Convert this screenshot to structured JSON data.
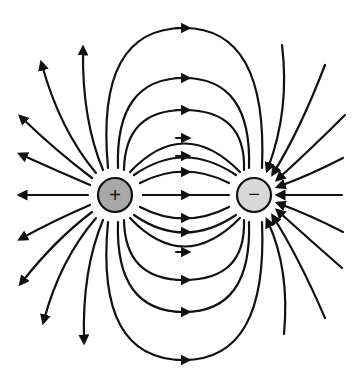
{
  "diagram": {
    "charges": [
      {
        "id": "positive",
        "sign": "+",
        "cx": 115,
        "cy": 195,
        "r": 17,
        "fill": "#a8a8a8"
      },
      {
        "id": "negative",
        "sign": "−",
        "cx": 254,
        "cy": 195,
        "r": 17,
        "fill": "#d8d8d8"
      }
    ],
    "stroke_color": "#111111",
    "background": "#ffffff"
  }
}
